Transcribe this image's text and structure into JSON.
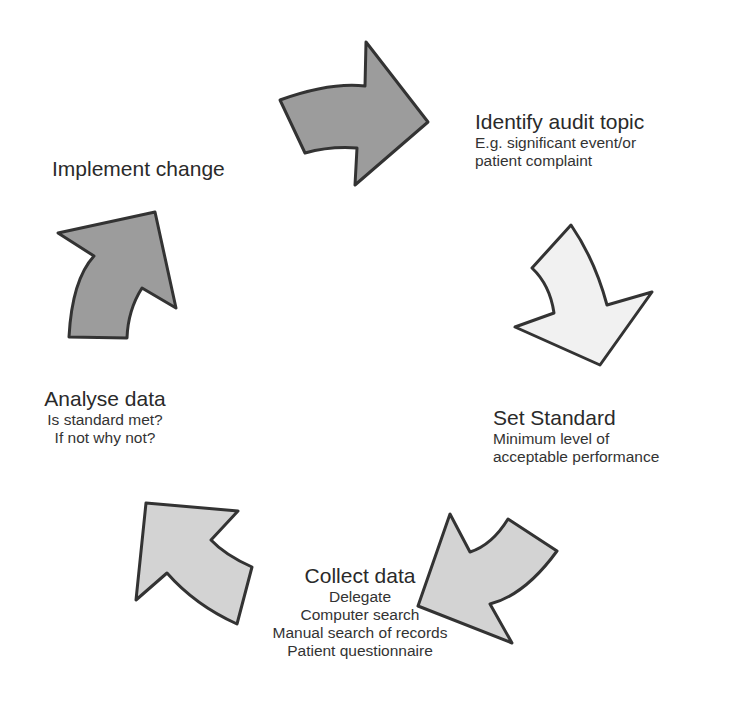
{
  "diagram": {
    "type": "cycle",
    "steps": [
      {
        "id": "identify",
        "title": "Identify audit topic",
        "lines": [
          "E.g. significant event/or",
          "patient complaint"
        ]
      },
      {
        "id": "standard",
        "title": "Set Standard",
        "lines": [
          "Minimum level of",
          "acceptable performance"
        ]
      },
      {
        "id": "collect",
        "title": "Collect data",
        "lines": [
          "Delegate",
          "Computer search",
          "Manual search of records",
          "Patient questionnaire"
        ]
      },
      {
        "id": "analyse",
        "title": "Analyse data",
        "lines": [
          "Is standard met?",
          "If not why not?"
        ]
      },
      {
        "id": "implement",
        "title": "Implement change",
        "lines": []
      }
    ],
    "arrows": [
      {
        "from": "implement",
        "to": "identify",
        "fill": "#9c9c9c"
      },
      {
        "from": "identify",
        "to": "standard",
        "fill": "#f1f1f1"
      },
      {
        "from": "standard",
        "to": "collect",
        "fill": "#d3d3d3"
      },
      {
        "from": "collect",
        "to": "analyse",
        "fill": "#d3d3d3"
      },
      {
        "from": "analyse",
        "to": "implement",
        "fill": "#9c9c9c"
      }
    ],
    "colors": {
      "outline": "#333333",
      "dark_fill": "#9c9c9c",
      "mid_fill": "#d3d3d3",
      "light_fill": "#f1f1f1",
      "text": "#2b2b2b"
    }
  }
}
